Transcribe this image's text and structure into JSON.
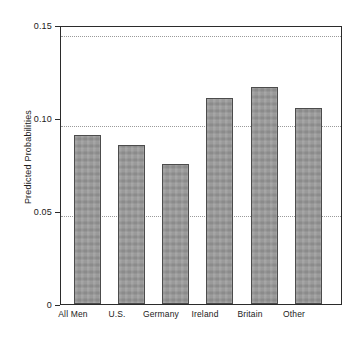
{
  "chart_data": {
    "type": "bar",
    "title": "",
    "subtitle": "",
    "xlabel": "",
    "ylabel": "Predicted Probabilities",
    "categories": [
      "All Men",
      "U.S.",
      "Germany",
      "Ireland",
      "Britain",
      "Other"
    ],
    "values": [
      0.094,
      0.0885,
      0.078,
      0.1145,
      0.1205,
      0.109
    ],
    "series": [
      {
        "name": "Predicted Probabilities",
        "values": [
          0.094,
          0.0885,
          0.078,
          0.1145,
          0.1205,
          0.109
        ]
      }
    ],
    "ylim": [
      0,
      0.155
    ],
    "xlim": [
      0,
      6
    ],
    "y_ticks": [
      0,
      0.05,
      0.1,
      0.15
    ],
    "y_tick_labels": [
      "0",
      "0.05",
      "0.10",
      "0.15"
    ],
    "grid": "horizontal-dotted",
    "legend": "none",
    "legend_position": "none",
    "bar_fill_color": "#969696",
    "bar_border_color": "#4c4c4c",
    "axis_color": "#2b2b2b",
    "gridline_color": "#9a9a9a",
    "background_color": "#ffffff",
    "annotations": []
  },
  "axes": {
    "y_title": "Predicted Probabilities",
    "y_tick_labels": [
      "0.15",
      "0.10",
      "0.05",
      "0"
    ],
    "x_tick_labels": [
      "All Men",
      "U.S.",
      "Germany",
      "Ireland",
      "Britain",
      "Other"
    ]
  }
}
